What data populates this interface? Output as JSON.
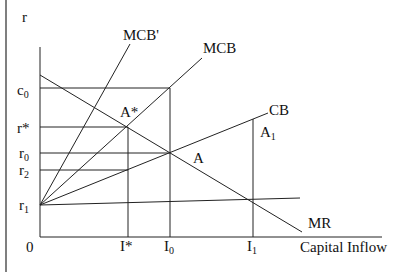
{
  "diagram": {
    "axis_y_label": "r",
    "axis_x_label": "Capital Inflow",
    "origin_label": "0",
    "y_ticks": {
      "c0": "c",
      "r_star": "r*",
      "r0": "r",
      "r2": "r",
      "r1": "r"
    },
    "y_tick_subs": {
      "c0": "0",
      "r0": "0",
      "r2": "2",
      "r1": "1"
    },
    "x_ticks": {
      "i_star": "I*",
      "i0": "I",
      "i1": "I"
    },
    "x_tick_subs": {
      "i0": "0",
      "i1": "1"
    },
    "curves": {
      "mcb_prime": "MCB'",
      "mcb": "MCB",
      "cb": "CB",
      "mr": "MR"
    },
    "points": {
      "a_star": "A*",
      "a": "A",
      "a1": "A",
      "a1_sub": "1"
    },
    "line_color": "#222222"
  }
}
